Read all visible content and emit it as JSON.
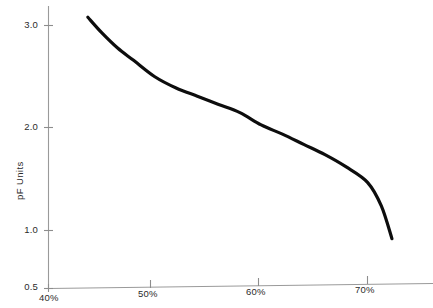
{
  "chart_data": {
    "type": "line",
    "title": "",
    "xlabel": "",
    "ylabel": "pF Units",
    "xlim": [
      40,
      72.5
    ],
    "ylim": [
      0.5,
      3.2
    ],
    "xticks": [
      "40%",
      "50%",
      "60%",
      "70%"
    ],
    "xtick_values": [
      40,
      50,
      60,
      70
    ],
    "yticks": [
      "0.5",
      "1.0",
      "2.0",
      "3.0"
    ],
    "ytick_values": [
      0.5,
      1.0,
      2.0,
      3.0
    ],
    "grid": false,
    "legend": "none",
    "series": [
      {
        "name": "pF Units",
        "x": [
          43.7,
          45,
          46.5,
          48,
          50,
          52,
          54,
          56,
          58,
          60,
          62,
          64,
          66,
          68,
          70,
          71.3,
          72.3
        ],
        "values": [
          3.08,
          2.93,
          2.78,
          2.66,
          2.5,
          2.39,
          2.31,
          2.23,
          2.15,
          2.03,
          1.94,
          1.84,
          1.74,
          1.62,
          1.47,
          1.24,
          0.92
        ]
      }
    ]
  },
  "axis": {
    "y_title": "pF Units",
    "y_tick_labels": [
      "3.0",
      "2.0",
      "1.0",
      "0.5"
    ],
    "x_tick_labels": [
      "40%",
      "50%",
      "60%",
      "70%"
    ]
  },
  "colors": {
    "curve": "#0d0d0d",
    "axis": "#9a9a9a",
    "text": "#2b2b2b",
    "background": "#ffffff"
  }
}
